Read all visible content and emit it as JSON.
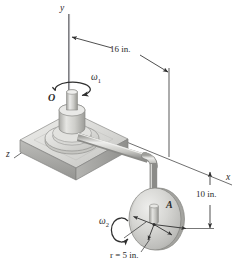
{
  "figure": {
    "axes": {
      "y_label": "y",
      "x_label": "x",
      "z_label": "z"
    },
    "points": {
      "origin_label": "O",
      "disk_center_label": "A"
    },
    "angular_velocities": {
      "omega1": "ω",
      "omega1_sub": "1",
      "omega2": "ω",
      "omega2_sub": "2"
    },
    "dimensions": {
      "horizontal": "16 in.",
      "vertical": "10 in.",
      "radius": "r = 5 in."
    },
    "colors": {
      "line": "#3a3a3a",
      "metal_light": "#e8e8e6",
      "metal_mid": "#c9c9c6",
      "metal_dark": "#a8a8a4",
      "metal_shadow": "#8d8d89",
      "background": "#ffffff"
    }
  }
}
